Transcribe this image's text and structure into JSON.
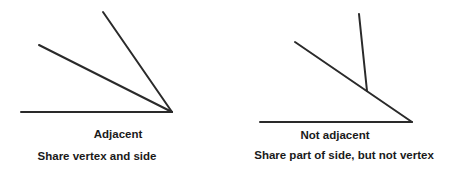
{
  "colors": {
    "line": "#2a2a2a",
    "text": "#1a1a1a",
    "background": "#ffffff"
  },
  "figures": [
    {
      "title": "Adjacent",
      "caption": "Share vertex and side",
      "lines": [
        {
          "x1": 21,
          "y1": 112,
          "x2": 172,
          "y2": 112
        },
        {
          "x1": 39,
          "y1": 45,
          "x2": 172,
          "y2": 112
        },
        {
          "x1": 103,
          "y1": 12,
          "x2": 172,
          "y2": 112
        }
      ]
    },
    {
      "title": "Not adjacent",
      "caption": "Share part of side, but not vertex",
      "lines": [
        {
          "x1": 260,
          "y1": 122,
          "x2": 412,
          "y2": 122
        },
        {
          "x1": 295,
          "y1": 42,
          "x2": 412,
          "y2": 122
        },
        {
          "x1": 359,
          "y1": 14,
          "x2": 367,
          "y2": 91
        }
      ]
    }
  ]
}
